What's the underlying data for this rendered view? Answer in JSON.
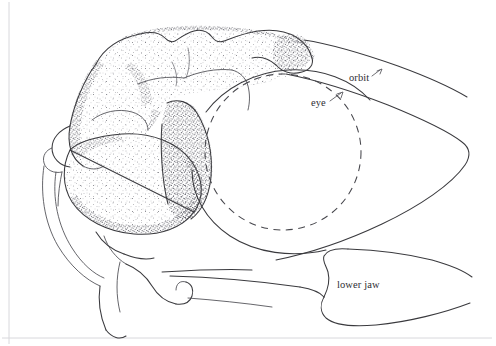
{
  "figure": {
    "kind": "anatomical-line-drawing",
    "technique": "pen-and-ink stipple shading",
    "orientation": "snout to the right, braincase to the left",
    "background_color": "#ffffff",
    "ink_color": "#3a3a3e",
    "border_color": "#d8d8dc",
    "width": 496,
    "height": 346
  },
  "labels": [
    {
      "id": "orbit",
      "text": "orbit",
      "x": 349,
      "y": 73,
      "leader": "short dash-tick pointing up-right to the orbit rim"
    },
    {
      "id": "eye",
      "text": "eye",
      "x": 311,
      "y": 98,
      "leader": "short dash-tick pointing up-right to the dashed eye outline"
    },
    {
      "id": "lower_jaw",
      "text": "lower jaw",
      "x": 337,
      "y": 280,
      "leader": "none; text sits inside the jaw outline"
    }
  ],
  "features": {
    "eye": {
      "name": "eye",
      "render": "dashed circle",
      "center_x": 283,
      "center_y": 152,
      "radius": 78
    },
    "orbit": {
      "name": "orbit",
      "render": "solid curved rim enclosing the eye circle"
    },
    "lower_jaw": {
      "name": "lower jaw",
      "render": "solid outline with hooked coronoid process at left"
    },
    "braincase": {
      "name": "braincase and cheek region",
      "render": "heavily stippled rounded masses at left"
    },
    "snout": {
      "name": "snout / rostrum",
      "render": "two long converging lines tapering to a point at right"
    }
  }
}
